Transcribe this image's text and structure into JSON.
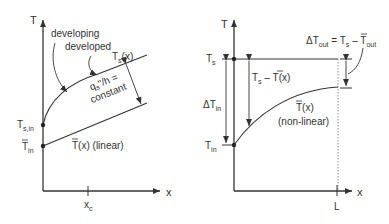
{
  "left_panel": {
    "y_axis_label": "T",
    "x_axis_label": "x",
    "label_developing": "developing",
    "label_developed": "developed",
    "surface_curve": {
      "main": "T",
      "sub": "s",
      "rest": "(x)"
    },
    "gap_label_line1": "q",
    "gap_label_sub": "s",
    "gap_label_line1_rest": "\"/h =",
    "gap_label_line2": "constant",
    "ts_in": {
      "main": "T",
      "sub": "s,in"
    },
    "t_in": {
      "main": "T",
      "sub": "in"
    },
    "mean_curve": {
      "main": "T",
      "rest": "(x) (linear)"
    },
    "x_tick": {
      "main": "x",
      "sub": "c"
    }
  },
  "right_panel": {
    "y_axis_label": "T",
    "x_axis_label": "x",
    "ts": {
      "main": "T",
      "sub": "s"
    },
    "t_in": {
      "main": "T",
      "sub": "in"
    },
    "delta_t_in": {
      "main": "ΔT",
      "sub": "in"
    },
    "ts_minus_t": {
      "a": "T",
      "a_sub": "s",
      "mid": " – ",
      "b": "T",
      "b_rest": "(x)"
    },
    "mean_curve": {
      "main": "T",
      "rest": "(x)",
      "line2": "(non-linear)"
    },
    "delta_t_out": {
      "main": "ΔT",
      "sub": "out",
      "eq": " = T",
      "eq_sub": "s",
      "mid": " – ",
      "b": "T",
      "b_sub": "out"
    },
    "x_tick": "L"
  },
  "colors": {
    "line": "#333333",
    "dashed": "#888888"
  }
}
